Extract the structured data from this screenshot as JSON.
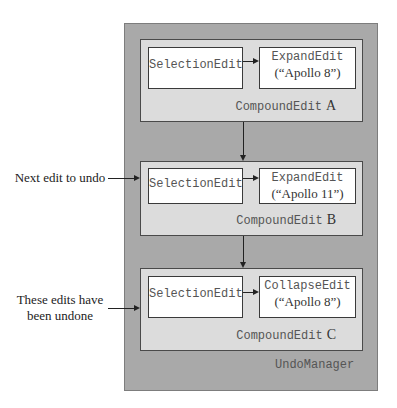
{
  "diagram": {
    "container_label": "UndoManager",
    "side_labels": {
      "next_edit": "Next edit to undo",
      "undone_line1": "These edits have",
      "undone_line2": "been undone"
    },
    "compound_edits": [
      {
        "label": "CompoundEdit",
        "letter": "A",
        "selection": "SelectionEdit",
        "second_type": "ExpandEdit",
        "second_arg": "(“Apollo 8”)"
      },
      {
        "label": "CompoundEdit",
        "letter": "B",
        "selection": "SelectionEdit",
        "second_type": "ExpandEdit",
        "second_arg": "(“Apollo 11”)"
      },
      {
        "label": "CompoundEdit",
        "letter": "C",
        "selection": "SelectionEdit",
        "second_type": "CollapseEdit",
        "second_arg": "(“Apollo 8”)"
      }
    ],
    "colors": {
      "manager_fill": "#a9a9a9",
      "compound_fill": "#dcdcdc",
      "edit_fill": "#ffffff",
      "line": "#222222"
    }
  }
}
